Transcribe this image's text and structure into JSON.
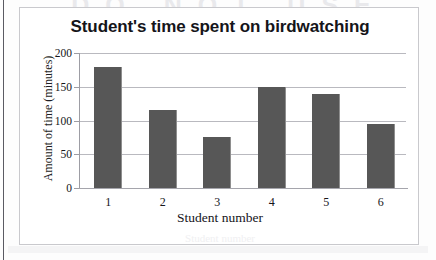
{
  "page": {
    "watermark_text": "DO NOT USE"
  },
  "chart_data": {
    "type": "bar",
    "title": "Student's time spent on birdwatching",
    "xlabel": "Student number",
    "ylabel": "Amount of time (minutes)",
    "categories": [
      "1",
      "2",
      "3",
      "4",
      "5",
      "6"
    ],
    "values": [
      180,
      115,
      75,
      150,
      140,
      95
    ],
    "yticks": [
      0,
      50,
      100,
      150,
      200
    ],
    "ytick_labels": [
      "0",
      "50",
      "100",
      "150",
      "200"
    ],
    "ylim": [
      0,
      200
    ],
    "grid": true,
    "legend": "none",
    "bar_color": "#575757",
    "gridline_color": "#b9b9bf",
    "frame_color": "#c9c9cd",
    "series": [
      {
        "name": "Time spent birdwatching",
        "values": [
          180,
          115,
          75,
          150,
          140,
          95
        ]
      }
    ]
  }
}
